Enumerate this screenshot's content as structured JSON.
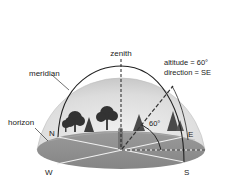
{
  "diagram": {
    "labels": {
      "zenith": "zenith",
      "meridian": "meridian",
      "horizon": "horizon",
      "altitude": "altitude = 60°",
      "direction": "direction = SE",
      "angle": "60°"
    },
    "compass": {
      "north": "N",
      "east": "E",
      "south": "S",
      "west": "W"
    },
    "colors": {
      "dome_fill": "#d9d9d9",
      "dome_inner": "#e8e8e8",
      "ground_fill": "#8f8f8f",
      "ground_light": "#a6a6a6",
      "line": "#222222",
      "white_line": "#f2f2f2",
      "tree": "#3a3a3a"
    }
  }
}
